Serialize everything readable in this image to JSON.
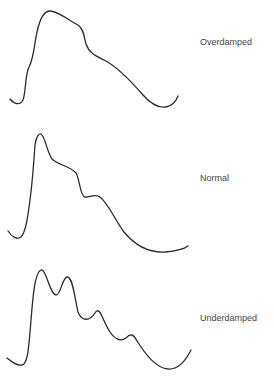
{
  "diagram": {
    "title": "",
    "stroke_color": "#2b2b2b",
    "label_color": "#444444",
    "waveforms": [
      {
        "name": "overdamped",
        "label": "Overdamped",
        "label_top": 37,
        "path": "M10,99 C14,104 20,106 23,100 C26,92 25,75 29,67 C34,58 34,45 37,32 C40,18 44,11 50,11 C58,11 68,20 78,25 C84,29 84,37 86,44 C89,53 96,56 104,60 C116,66 130,80 143,95 C152,105 160,108 166,107 C172,106 176,101 178,96"
      },
      {
        "name": "normal",
        "label": "Normal",
        "label_top": 173,
        "path": "M8,231 C12,237 17,240 21,237 C26,232 28,215 30,200 C32,185 34,160 35,145 C36,137 39,133 41,134 C45,136 47,152 52,159 C58,165 70,166 76,173 C80,180 80,196 85,197 C89,198 94,193 100,197 C108,203 115,220 124,232 C134,244 148,253 165,252 C176,251 183,250 188,246"
      },
      {
        "name": "underdamped",
        "label": "Underdamped",
        "label_top": 313,
        "path": "M7,358 C12,362 17,366 22,365 C28,364 29,345 31,320 C33,295 35,272 41,270 C46,268 50,295 56,295 C61,295 62,278 67,277 C73,276 75,300 78,312 C82,322 90,321 95,313 C100,305 102,320 110,332 C116,341 122,341 126,338 C130,334 133,333 137,341 C146,355 156,368 168,369 C180,370 187,358 191,350"
      }
    ]
  }
}
